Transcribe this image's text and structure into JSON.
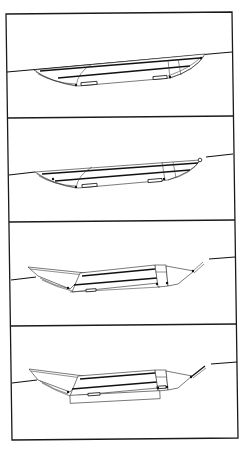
{
  "figure": {
    "panel_count": 4,
    "colors": {
      "line": "#111111",
      "background": "#ffffff"
    },
    "panels": [
      {
        "index": 1,
        "label": "",
        "state": "lowered, flush with ground line"
      },
      {
        "index": 2,
        "label": "",
        "state": "lowered, rear arm slightly raised"
      },
      {
        "index": 3,
        "label": "",
        "state": "front wing raised, rear arm extended"
      },
      {
        "index": 4,
        "label": "",
        "state": "front wing raised, rear arm fully extended"
      }
    ]
  }
}
